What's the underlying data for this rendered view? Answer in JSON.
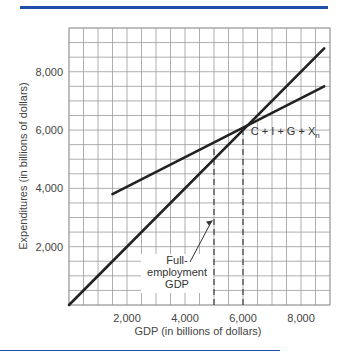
{
  "colors": {
    "rule": "#1f4fa8",
    "grid": "#9a9a9a",
    "line": "#222222"
  },
  "chart_data": {
    "type": "line",
    "title": "",
    "xlabel": "GDP (in billions of dollars)",
    "ylabel": "Expenditures (in billions of dollars)",
    "xlim": [
      0,
      9000
    ],
    "ylim": [
      0,
      9500
    ],
    "grid": true,
    "grid_step": 500,
    "x_ticks": [
      2000,
      4000,
      6000,
      8000
    ],
    "x_tick_labels": [
      "2,000",
      "4,000",
      "6,000",
      "8,000"
    ],
    "y_ticks": [
      2000,
      4000,
      6000,
      8000
    ],
    "y_tick_labels": [
      "2,000",
      "4,000",
      "6,000",
      "8,000"
    ],
    "series": [
      {
        "name": "45-degree line",
        "x": [
          0,
          8800
        ],
        "y": [
          0,
          8800
        ]
      },
      {
        "name": "C + I + G + Xn",
        "x": [
          1500,
          8800
        ],
        "y": [
          3800,
          7500
        ]
      }
    ],
    "reference_lines": [
      {
        "type": "vertical-dashed",
        "x": 5000,
        "y_top": 5400,
        "label": "Full-employment GDP"
      },
      {
        "type": "vertical-dashed",
        "x": 6000,
        "y_top": 6000
      }
    ],
    "equilibrium": {
      "x": 6000,
      "y": 6000
    },
    "annotations": [
      {
        "text": "C + I + G + X",
        "subscript": "n",
        "x": 6200,
        "y": 6000
      },
      {
        "text_lines": [
          "Full-",
          "employment",
          "GDP"
        ],
        "arrow_to": {
          "x": 5000,
          "y": 2900
        }
      }
    ]
  }
}
